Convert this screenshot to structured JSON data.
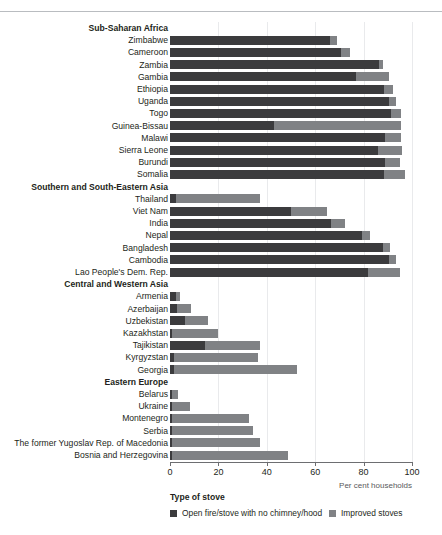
{
  "top_rule": true,
  "ghost_title": "",
  "chart_data": {
    "type": "bar",
    "orientation": "horizontal",
    "stacked": true,
    "title": "",
    "xlabel": "Per cent households",
    "ylabel": "",
    "xlim": [
      0,
      100
    ],
    "xticks": [
      0,
      20,
      40,
      60,
      80,
      100
    ],
    "grid": "vertical",
    "legend": {
      "title": "Type of stove",
      "position": "bottom",
      "entries": [
        {
          "name": "Open fire/stove with no chimney/hood",
          "color": "#3b3b3d"
        },
        {
          "name": "Improved stoves",
          "color": "#808285"
        }
      ]
    },
    "series": [
      {
        "name": "Open fire/stove with no chimney/hood",
        "color": "#3b3b3d"
      },
      {
        "name": "Improved stoves",
        "color": "#808285"
      }
    ],
    "rows": [
      {
        "label": "Sub-Saharan Africa",
        "group": true
      },
      {
        "label": "Zimbabwe",
        "group": false,
        "values": [
          66.0,
          3.0
        ]
      },
      {
        "label": "Cameroon",
        "group": false,
        "values": [
          70.5,
          4.0
        ]
      },
      {
        "label": "Zambia",
        "group": false,
        "values": [
          86.5,
          1.5
        ]
      },
      {
        "label": "Gambia",
        "group": false,
        "values": [
          77.0,
          13.5
        ]
      },
      {
        "label": "Ethiopia",
        "group": false,
        "values": [
          88.5,
          3.5
        ]
      },
      {
        "label": "Uganda",
        "group": false,
        "values": [
          90.5,
          3.0
        ]
      },
      {
        "label": "Togo",
        "group": false,
        "values": [
          91.5,
          4.0
        ]
      },
      {
        "label": "Guinea-Bissau",
        "group": false,
        "values": [
          43.0,
          52.5
        ]
      },
      {
        "label": "Malawi",
        "group": false,
        "values": [
          89.0,
          6.5
        ]
      },
      {
        "label": "Sierra Leone",
        "group": false,
        "values": [
          86.0,
          10.0
        ]
      },
      {
        "label": "Burundi",
        "group": false,
        "values": [
          89.0,
          6.0
        ]
      },
      {
        "label": "Somalia",
        "group": false,
        "values": [
          88.5,
          8.5
        ]
      },
      {
        "label": "Southern and South-Eastern Asia",
        "group": true
      },
      {
        "label": "Thailand",
        "group": false,
        "values": [
          2.5,
          34.5
        ]
      },
      {
        "label": "Viet Nam",
        "group": false,
        "values": [
          50.0,
          15.0
        ]
      },
      {
        "label": "India",
        "group": false,
        "values": [
          66.5,
          6.0
        ]
      },
      {
        "label": "Nepal",
        "group": false,
        "values": [
          79.5,
          3.0
        ]
      },
      {
        "label": "Bangladesh",
        "group": false,
        "values": [
          88.0,
          3.0
        ]
      },
      {
        "label": "Cambodia",
        "group": false,
        "values": [
          90.5,
          3.0
        ]
      },
      {
        "label": "Lao People's Dem. Rep.",
        "group": false,
        "values": [
          82.0,
          13.0
        ]
      },
      {
        "label": "Central and Western Asia",
        "group": true
      },
      {
        "label": "Armenia",
        "group": false,
        "values": [
          2.5,
          1.5
        ]
      },
      {
        "label": "Azerbaijan",
        "group": false,
        "values": [
          3.0,
          5.5
        ]
      },
      {
        "label": "Uzbekistan",
        "group": false,
        "values": [
          6.0,
          9.5
        ]
      },
      {
        "label": "Kazakhstan",
        "group": false,
        "values": [
          1.0,
          19.0
        ]
      },
      {
        "label": "Tajikistan",
        "group": false,
        "values": [
          14.5,
          22.5
        ]
      },
      {
        "label": "Kyrgyzstan",
        "group": false,
        "values": [
          1.5,
          35.0
        ]
      },
      {
        "label": "Georgia",
        "group": false,
        "values": [
          1.5,
          51.0
        ]
      },
      {
        "label": "Eastern Europe",
        "group": true
      },
      {
        "label": "Belarus",
        "group": false,
        "values": [
          0.8,
          2.5
        ]
      },
      {
        "label": "Ukraine",
        "group": false,
        "values": [
          0.8,
          7.5
        ]
      },
      {
        "label": "Montenegro",
        "group": false,
        "values": [
          0.8,
          32.0
        ]
      },
      {
        "label": "Serbia",
        "group": false,
        "values": [
          0.8,
          33.5
        ]
      },
      {
        "label": "The former Yugoslav Rep. of Macedonia",
        "group": false,
        "values": [
          0.8,
          36.5
        ]
      },
      {
        "label": "Bosnia and Herzegovina",
        "group": false,
        "values": [
          0.8,
          48.0
        ]
      }
    ]
  }
}
